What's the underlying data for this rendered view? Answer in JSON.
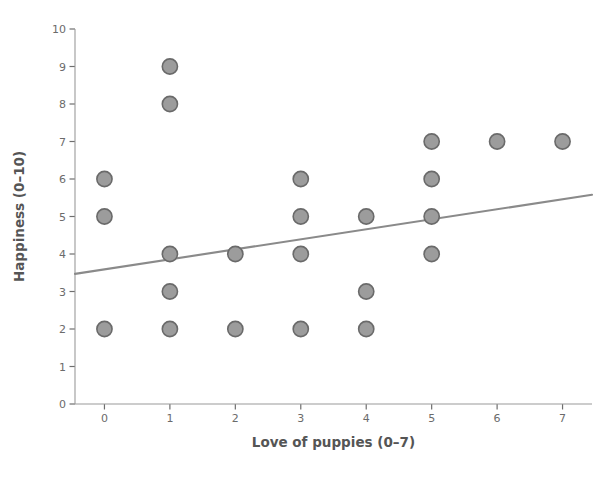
{
  "chart_data": {
    "type": "scatter",
    "title": "",
    "xlabel": "Love of puppies (0–7)",
    "ylabel": "Happiness (0–10)",
    "xlim": [
      -0.45,
      7.45
    ],
    "ylim": [
      0,
      10
    ],
    "xticks": [
      0,
      1,
      2,
      3,
      4,
      5,
      6,
      7
    ],
    "xticklabels": [
      "0",
      "1",
      "2",
      "3",
      "4",
      "5",
      "6",
      "7"
    ],
    "yticks": [
      0,
      1,
      2,
      3,
      4,
      5,
      6,
      7,
      8,
      9,
      10
    ],
    "yticklabels": [
      "0",
      "1",
      "2",
      "3",
      "4",
      "5",
      "6",
      "7",
      "8",
      "9",
      "10"
    ],
    "grid": false,
    "legend": null,
    "points": [
      {
        "x": 0,
        "y": 6
      },
      {
        "x": 0,
        "y": 5
      },
      {
        "x": 0,
        "y": 2
      },
      {
        "x": 1,
        "y": 9
      },
      {
        "x": 1,
        "y": 8
      },
      {
        "x": 1,
        "y": 4
      },
      {
        "x": 1,
        "y": 3
      },
      {
        "x": 1,
        "y": 2
      },
      {
        "x": 2,
        "y": 4
      },
      {
        "x": 2,
        "y": 2
      },
      {
        "x": 3,
        "y": 6
      },
      {
        "x": 3,
        "y": 5
      },
      {
        "x": 3,
        "y": 4
      },
      {
        "x": 3,
        "y": 2
      },
      {
        "x": 4,
        "y": 5
      },
      {
        "x": 4,
        "y": 3
      },
      {
        "x": 4,
        "y": 2
      },
      {
        "x": 5,
        "y": 7
      },
      {
        "x": 5,
        "y": 6
      },
      {
        "x": 5,
        "y": 5
      },
      {
        "x": 5,
        "y": 4
      },
      {
        "x": 6,
        "y": 7
      },
      {
        "x": 7,
        "y": 7
      }
    ],
    "trend_line": {
      "x": [
        -0.45,
        7.45
      ],
      "y": [
        3.47,
        5.58
      ]
    },
    "marker_fill_color": "#9c9c9c",
    "marker_edge_color": "#6a6a6a",
    "trend_line_color": "#8a8a8a",
    "axis_color": "#9a9a9a",
    "background_color": "#ffffff"
  }
}
